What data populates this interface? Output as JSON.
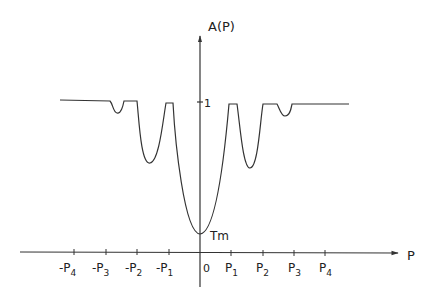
{
  "figure": {
    "y_axis_label": "A(P)",
    "x_axis_label": "P",
    "unity_label": "1",
    "minimum_label": "Tm",
    "origin_label": "0",
    "x_ticks": [
      {
        "sign": "-",
        "base": "P",
        "sub": "4"
      },
      {
        "sign": "-",
        "base": "P",
        "sub": "3"
      },
      {
        "sign": "-",
        "base": "P",
        "sub": "2"
      },
      {
        "sign": "-",
        "base": "P",
        "sub": "1"
      },
      {
        "sign": "",
        "base": "P",
        "sub": "1"
      },
      {
        "sign": "",
        "base": "P",
        "sub": "2"
      },
      {
        "sign": "",
        "base": "P",
        "sub": "3"
      },
      {
        "sign": "",
        "base": "P",
        "sub": "4"
      }
    ],
    "line_color": "#333333"
  }
}
